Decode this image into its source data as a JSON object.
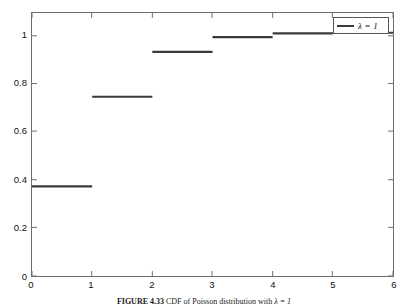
{
  "figure": {
    "caption_label": "FIGURE 4.33",
    "caption_text": "CDF of Poisson distribution with",
    "caption_symbol": "λ = 1"
  },
  "legend": {
    "position": "top-right",
    "entries": [
      {
        "label": "λ = 1",
        "color": "#3a3a3a",
        "marker": "line"
      }
    ]
  },
  "axes": {
    "x_ticks": [
      "0",
      "1",
      "2",
      "3",
      "4",
      "5",
      "6"
    ],
    "y_ticks": [
      "0",
      "0.2",
      "0.4",
      "0.6",
      "0.8",
      "1"
    ],
    "box_color": "#6e6e6e",
    "background": "#ffffff"
  },
  "chart_data": {
    "type": "line",
    "subtype": "step-post",
    "title": "",
    "subtitle": "",
    "xlabel": "",
    "ylabel": "",
    "xlim": [
      0,
      6
    ],
    "ylim": [
      0,
      1.08
    ],
    "grid": false,
    "legend_position": "upper right",
    "x_ticks": [
      0,
      1,
      2,
      3,
      4,
      5,
      6
    ],
    "y_ticks": [
      0,
      0.2,
      0.4,
      0.6,
      0.8,
      1
    ],
    "series": [
      {
        "name": "λ = 1",
        "color": "#3a3a3a",
        "linewidth": 2,
        "x": [
          0,
          1,
          2,
          3,
          4,
          5,
          6
        ],
        "values": [
          0.368,
          0.736,
          0.92,
          0.981,
          0.996,
          0.999,
          1.0
        ],
        "steps": [
          {
            "x_start": 0,
            "x_end": 1,
            "y": 0.368
          },
          {
            "x_start": 1,
            "x_end": 2,
            "y": 0.736
          },
          {
            "x_start": 2,
            "x_end": 3,
            "y": 0.92
          },
          {
            "x_start": 3,
            "x_end": 4,
            "y": 0.981
          },
          {
            "x_start": 4,
            "x_end": 5,
            "y": 0.996
          },
          {
            "x_start": 5,
            "x_end": 6,
            "y": 0.999
          }
        ]
      }
    ],
    "annotations": []
  }
}
